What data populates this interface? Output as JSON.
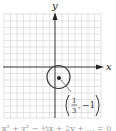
{
  "figure": {
    "axis_labels": {
      "x": "x",
      "y": "y"
    },
    "grid": {
      "x_min": -8,
      "x_max": 7,
      "y_min": -8,
      "y_max": 8,
      "color": "#d9d9d9"
    },
    "axes_color": "#333333",
    "circle": {
      "center_label": "(1/3, −1)",
      "center": [
        0.333,
        -1
      ],
      "radius": 1.8,
      "stroke": "#333333"
    },
    "point_label": {
      "numerator": "1",
      "denominator": "3",
      "y_value": "−1"
    }
  },
  "caption": {
    "text": "x² + y² − ⅔x + 2y + … = 0"
  }
}
